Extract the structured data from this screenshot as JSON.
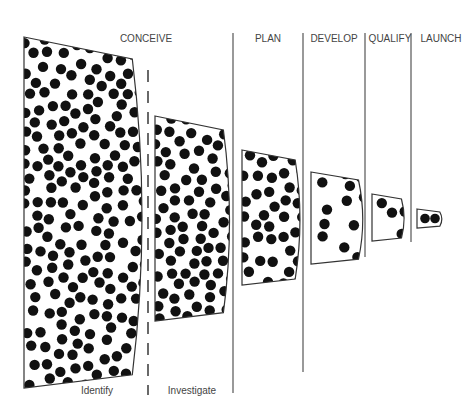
{
  "stages": [
    {
      "label": "CONCEIVE",
      "x": 146,
      "y": 33
    },
    {
      "label": "PLAN",
      "x": 268,
      "y": 33
    },
    {
      "label": "DEVELOP",
      "x": 334,
      "y": 33
    },
    {
      "label": "QUALIFY",
      "x": 390,
      "y": 33
    },
    {
      "label": "LAUNCH",
      "x": 441,
      "y": 33
    }
  ],
  "substages": [
    {
      "label": "Identify",
      "x": 97,
      "y": 385
    },
    {
      "label": "Investigate",
      "x": 192,
      "y": 385
    }
  ],
  "dividers": [
    {
      "x": 148,
      "y1": 70,
      "y2": 395,
      "dashed": true
    },
    {
      "x": 233,
      "y1": 33,
      "y2": 393,
      "dashed": false
    },
    {
      "x": 303,
      "y1": 33,
      "y2": 372,
      "dashed": false
    },
    {
      "x": 365,
      "y1": 33,
      "y2": 257,
      "dashed": false
    },
    {
      "x": 411,
      "y1": 33,
      "y2": 242,
      "dashed": false
    }
  ],
  "funnels": [
    {
      "name": "identify",
      "x": 24,
      "top": 37,
      "bottom": 388,
      "right": 138,
      "shoulderTop": 60,
      "shoulderBot": 65,
      "slope": 22,
      "dots": 330,
      "r": 5.2
    },
    {
      "name": "investigate",
      "x": 155,
      "top": 116,
      "bottom": 321,
      "right": 227,
      "shoulderTop": 130,
      "shoulderBot": 13,
      "slope": 14,
      "dots": 140,
      "r": 5.2
    },
    {
      "name": "plan",
      "x": 242,
      "top": 150,
      "bottom": 285,
      "right": 298,
      "shoulderTop": 20,
      "shoulderBot": 20,
      "slope": 10,
      "dots": 38,
      "r": 5.2
    },
    {
      "name": "develop",
      "x": 311,
      "top": 172,
      "bottom": 264,
      "right": 361,
      "shoulderTop": 14,
      "shoulderBot": 14,
      "slope": 8,
      "dots": 12,
      "r": 5.2
    },
    {
      "name": "qualify",
      "x": 372,
      "top": 194,
      "bottom": 241,
      "right": 403,
      "shoulderTop": 8,
      "shoulderBot": 8,
      "slope": 5,
      "dots": 4,
      "r": 5.2
    },
    {
      "name": "launch",
      "x": 417,
      "top": 209,
      "bottom": 228,
      "right": 441,
      "shoulderTop": 4,
      "shoulderBot": 4,
      "slope": 3,
      "dots": 2,
      "r": 4.8
    }
  ],
  "colors": {
    "stroke": "#333333",
    "dot": "#111111",
    "text": "#444444"
  }
}
